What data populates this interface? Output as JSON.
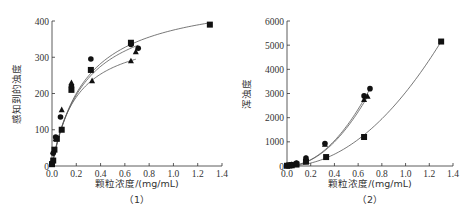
{
  "chart_data": [
    {
      "type": "scatter",
      "panel_label": "（1）",
      "title": "",
      "xlabel": "颗粒浓度/(mg/mL)",
      "ylabel": "感知到的浊度",
      "xlim": [
        0,
        1.4
      ],
      "ylim": [
        0,
        400
      ],
      "xticks": [
        "0.0",
        "0.2",
        "0.4",
        "0.6",
        "0.8",
        "1.0",
        "1.2",
        "1.4"
      ],
      "yticks": [
        "0",
        "100",
        "200",
        "300",
        "400"
      ],
      "grid": false,
      "legend": null,
      "series": [
        {
          "name": "square",
          "marker": "square",
          "x": [
            0.0,
            0.01,
            0.02,
            0.04,
            0.08,
            0.16,
            0.32,
            0.65,
            1.3
          ],
          "y": [
            5,
            15,
            45,
            75,
            100,
            210,
            265,
            340,
            390
          ]
        },
        {
          "name": "circle",
          "marker": "circle",
          "x": [
            0.0,
            0.01,
            0.03,
            0.07,
            0.16,
            0.32,
            0.65,
            0.71
          ],
          "y": [
            8,
            35,
            80,
            135,
            220,
            295,
            335,
            325
          ]
        },
        {
          "name": "triangle",
          "marker": "triangle",
          "x": [
            0.0,
            0.01,
            0.03,
            0.08,
            0.16,
            0.33,
            0.65,
            0.69
          ],
          "y": [
            5,
            40,
            75,
            155,
            230,
            235,
            290,
            315
          ]
        }
      ]
    },
    {
      "type": "scatter",
      "panel_label": "（2）",
      "title": "",
      "xlabel": "颗粒浓度/(mg/mL)",
      "ylabel": "浑浊度",
      "xlim": [
        0,
        1.4
      ],
      "ylim": [
        0,
        6000
      ],
      "xticks": [
        "0.0",
        "0.2",
        "0.4",
        "0.6",
        "0.8",
        "1.0",
        "1.2",
        "1.4"
      ],
      "yticks": [
        "0",
        "1000",
        "2000",
        "3000",
        "4000",
        "5000",
        "6000"
      ],
      "grid": false,
      "legend": null,
      "series": [
        {
          "name": "square",
          "marker": "square",
          "x": [
            0.0,
            0.02,
            0.04,
            0.08,
            0.16,
            0.33,
            0.65,
            1.3
          ],
          "y": [
            10,
            20,
            30,
            60,
            180,
            370,
            1200,
            5150
          ]
        },
        {
          "name": "circle",
          "marker": "circle",
          "x": [
            0.0,
            0.02,
            0.04,
            0.08,
            0.16,
            0.32,
            0.65,
            0.7
          ],
          "y": [
            20,
            40,
            60,
            120,
            330,
            930,
            2900,
            3200
          ]
        },
        {
          "name": "triangle",
          "marker": "triangle",
          "x": [
            0.0,
            0.02,
            0.04,
            0.08,
            0.16,
            0.32,
            0.65,
            0.68
          ],
          "y": [
            15,
            35,
            55,
            110,
            320,
            900,
            2750,
            2880
          ]
        }
      ]
    }
  ]
}
